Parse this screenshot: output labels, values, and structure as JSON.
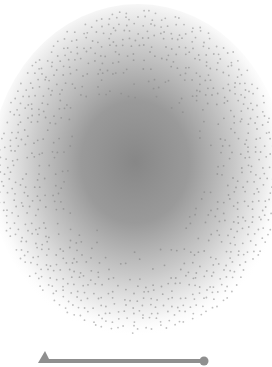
{
  "figure": {
    "sphere": {
      "center_x": 138,
      "center_y": 172,
      "radius_x": 142,
      "radius_y": 162,
      "core_color": "#8a8a8a",
      "edge_color": "#ffffff",
      "dot_color": "#8c8c8c"
    },
    "line": {
      "x1": 44,
      "x2": 204,
      "y": 361,
      "color": "#8f8f8f",
      "start_marker": "triangle",
      "end_marker": "circle"
    }
  }
}
